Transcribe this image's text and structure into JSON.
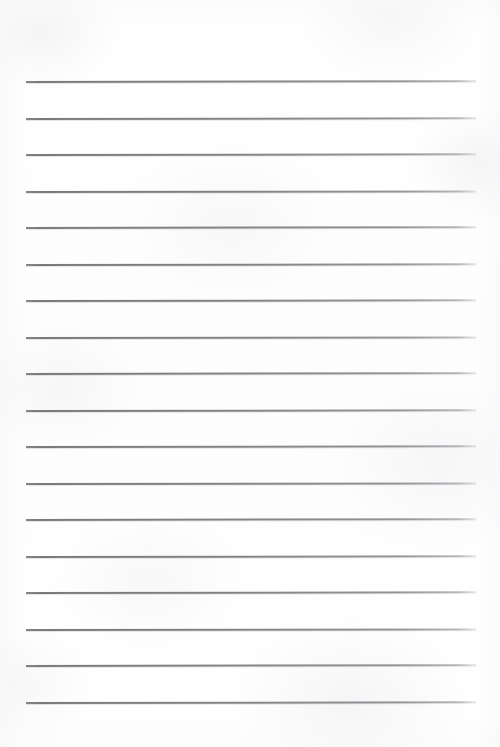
{
  "document": {
    "kind": "lined-notebook-page",
    "title": "",
    "visible_text": "",
    "page_width": 500,
    "page_height": 747,
    "background_color": "#ffffff",
    "rule_color": "#80808 4",
    "rule_color_hex": "#808084",
    "rule_count": 18,
    "rule_left_x": 26,
    "rule_right_x": 476,
    "rule_first_y": 81,
    "rule_spacing": 36.5,
    "rule_thickness": 1.5,
    "top_margin": 81,
    "bottom_margin": 45,
    "left_margin": 26,
    "right_margin": 24,
    "rules": [
      {
        "index": 1,
        "y": 81,
        "tilt_deg": -0.1
      },
      {
        "index": 2,
        "y": 117.5,
        "tilt_deg": -0.08
      },
      {
        "index": 3,
        "y": 154,
        "tilt_deg": -0.09
      },
      {
        "index": 4,
        "y": 190.5,
        "tilt_deg": -0.07
      },
      {
        "index": 5,
        "y": 227,
        "tilt_deg": -0.1
      },
      {
        "index": 6,
        "y": 263.5,
        "tilt_deg": -0.08
      },
      {
        "index": 7,
        "y": 300,
        "tilt_deg": -0.09
      },
      {
        "index": 8,
        "y": 336.5,
        "tilt_deg": -0.07
      },
      {
        "index": 9,
        "y": 373,
        "tilt_deg": -0.1
      },
      {
        "index": 10,
        "y": 409.5,
        "tilt_deg": -0.08
      },
      {
        "index": 11,
        "y": 446,
        "tilt_deg": -0.09
      },
      {
        "index": 12,
        "y": 482.5,
        "tilt_deg": -0.07
      },
      {
        "index": 13,
        "y": 519,
        "tilt_deg": -0.1
      },
      {
        "index": 14,
        "y": 555.5,
        "tilt_deg": -0.08
      },
      {
        "index": 15,
        "y": 592,
        "tilt_deg": -0.09
      },
      {
        "index": 16,
        "y": 628.5,
        "tilt_deg": -0.07
      },
      {
        "index": 17,
        "y": 665,
        "tilt_deg": -0.1
      },
      {
        "index": 18,
        "y": 702,
        "tilt_deg": -0.08
      }
    ]
  }
}
